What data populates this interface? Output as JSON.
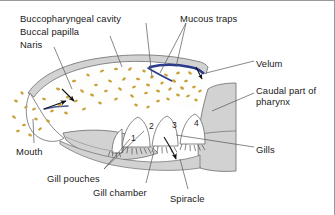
{
  "figure": {
    "background_color": "#ffffff",
    "tissue_fill": "#d2d2d2",
    "tissue_stroke": "#5a5a5a",
    "cavity_fill": "#fdfdfb",
    "particle_color": "#c8a23c",
    "velum_color": "#2a3a8c",
    "label_color": "#1a1a1a",
    "leader_color": "#555555"
  },
  "labels": [
    {
      "id": "buccopharyngeal-cavity",
      "text": "Buccopharyngeal cavity",
      "x": 20,
      "y": 12
    },
    {
      "id": "buccal-papilla",
      "text": "Buccal papilla",
      "x": 20,
      "y": 25
    },
    {
      "id": "naris",
      "text": "Naris",
      "x": 20,
      "y": 38
    },
    {
      "id": "mucous-traps",
      "text": "Mucous traps",
      "x": 180,
      "y": 12
    },
    {
      "id": "velum",
      "text": "Velum",
      "x": 256,
      "y": 57
    },
    {
      "id": "caudal-part-of-pharynx",
      "text": "Caudal part of pharynx",
      "x": 256,
      "y": 88
    },
    {
      "id": "gills",
      "text": "Gills",
      "x": 256,
      "y": 143
    },
    {
      "id": "mouth",
      "text": "Mouth",
      "x": 16,
      "y": 145
    },
    {
      "id": "gill-pouches",
      "text": "Gill pouches",
      "x": 47,
      "y": 172
    },
    {
      "id": "gill-chamber",
      "text": "Gill chamber",
      "x": 93,
      "y": 186
    },
    {
      "id": "spiracle",
      "text": "Spiracle",
      "x": 170,
      "y": 192
    }
  ],
  "gill_pouch_numbers": [
    {
      "label": "1",
      "x": 131,
      "y": 132
    },
    {
      "label": "2",
      "x": 149,
      "y": 120
    },
    {
      "label": "3",
      "x": 172,
      "y": 119
    },
    {
      "label": "4",
      "x": 194,
      "y": 117
    }
  ],
  "annotations": {
    "flow_arrows": 4,
    "particle_count": 58,
    "description": "Sagittal section showing water and mucus flow from mouth through buccopharyngeal cavity past the velum into the gill pouches."
  }
}
